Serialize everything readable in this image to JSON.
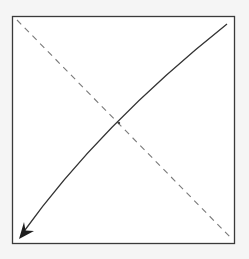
{
  "diagram": {
    "background": "#f5f5f5",
    "box": {
      "x": 12.5,
      "y": 16.5,
      "width": 222,
      "height": 227,
      "fill": "#ffffff",
      "stroke": "#3a3a3a",
      "stroke_width": 1.3
    },
    "dashed_line": {
      "x1": 17,
      "y1": 20,
      "x2": 231,
      "y2": 238,
      "stroke": "#7a7a7a",
      "stroke_width": 1.1,
      "dasharray": "6,5"
    },
    "arrow_curve": {
      "path": "M 227 24 Q 100 125 22 234",
      "stroke": "#333333",
      "stroke_width": 1.3,
      "arrowhead": "filled-barbed",
      "arrowhead_path": "M 19 239 L 24 222 L 25.5 230.5 L 34 231 Z",
      "arrowhead_fill": "#1e1e1e"
    },
    "intersection_marker": {
      "cx": 119,
      "cy": 123
    }
  }
}
